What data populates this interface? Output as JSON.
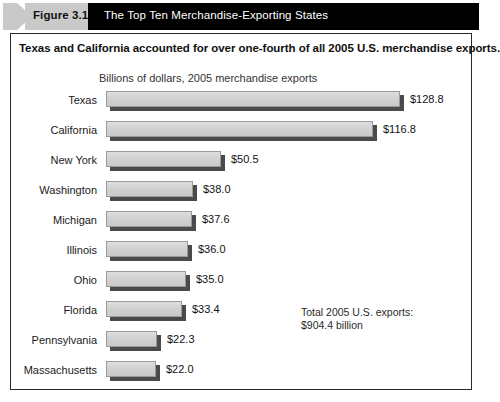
{
  "banner": {
    "figure_label": "Figure 3.1",
    "title": "The Top Ten Merchandise-Exporting States",
    "chevron_color": "#c9c9c9",
    "bar_color": "#000000",
    "title_color": "#ffffff"
  },
  "headline": "Texas and California accounted for over one-fourth of all 2005 U.S. merchandise exports.",
  "note": "Total 2005 U.S. exports:\n$904.4 billion",
  "chart_data": {
    "type": "bar",
    "orientation": "horizontal",
    "title": "Billions of dollars, 2005 merchandise exports",
    "xlabel": "",
    "ylabel": "",
    "xlim": [
      0,
      140
    ],
    "grid": false,
    "legend": "none",
    "units": "billions of U.S. dollars",
    "categories": [
      "Texas",
      "California",
      "New York",
      "Washington",
      "Michigan",
      "Illinois",
      "Ohio",
      "Florida",
      "Pennsylvania",
      "Massachusetts"
    ],
    "values": [
      128.8,
      116.8,
      50.5,
      38.0,
      37.6,
      36.0,
      35.0,
      33.4,
      22.3,
      22.0
    ],
    "value_labels": [
      "$128.8",
      "$116.8",
      "$50.5",
      "$38.0",
      "$37.6",
      "$36.0",
      "$35.0",
      "$33.4",
      "$22.3",
      "$22.0"
    ],
    "bar_face_color": "#d2d2d2",
    "bar_shadow_color": "#4a4a4a",
    "annotations": [
      "Total 2005 U.S. exports: $904.4 billion"
    ]
  }
}
